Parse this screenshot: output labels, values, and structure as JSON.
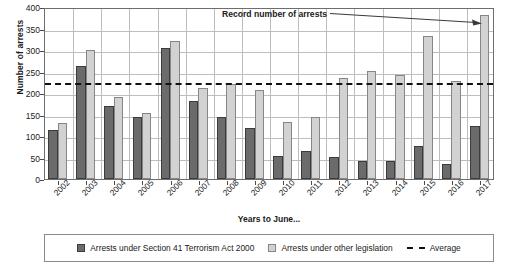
{
  "chart_data": {
    "type": "bar",
    "title": "",
    "xlabel": "Years to June...",
    "ylabel": "Number of arrests",
    "ylim": [
      0,
      400
    ],
    "ytick_step": 50,
    "yticks": [
      "400",
      "350",
      "300",
      "250",
      "200",
      "150",
      "100",
      "50",
      "0"
    ],
    "grid": true,
    "legend_position": "bottom",
    "categories": [
      "2002",
      "2003",
      "2004",
      "2005",
      "2006",
      "2007",
      "2008",
      "2009",
      "2010",
      "2011",
      "2012",
      "2013",
      "2014",
      "2015",
      "2016",
      "2017"
    ],
    "series": [
      {
        "name": "Arrests under Section 41 Terrorism Act 2000",
        "color": "#6b6b6b",
        "values": [
          115,
          262,
          169,
          144,
          304,
          181,
          144,
          119,
          54,
          64,
          52,
          41,
          43,
          76,
          36,
          124
        ]
      },
      {
        "name": "Arrests under other legislation",
        "color": "#d2d2d2",
        "values": [
          130,
          300,
          191,
          154,
          322,
          212,
          221,
          208,
          132,
          144,
          236,
          252,
          242,
          333,
          228,
          382
        ]
      }
    ],
    "reference_line": {
      "name": "Average",
      "value": 228,
      "style": "dashed",
      "color": "#111111"
    },
    "annotations": [
      {
        "text": "Record number of arrests",
        "points_to_category": "2017",
        "points_to_series": "Arrests under other legislation"
      }
    ]
  },
  "legend": {
    "items": [
      {
        "label": "Arrests under Section 41 Terrorism Act 2000",
        "marker": "filled-dark-square"
      },
      {
        "label": "Arrests under other legislation",
        "marker": "filled-light-square"
      },
      {
        "label": "Average",
        "marker": "dashed-line"
      }
    ]
  }
}
